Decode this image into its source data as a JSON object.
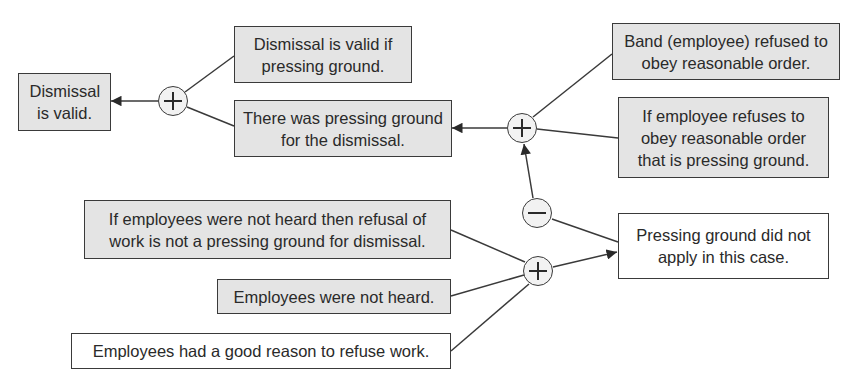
{
  "diagram": {
    "type": "argument-map",
    "nodes": {
      "conclusion": {
        "text": "Dismissal is valid.",
        "style": "grey"
      },
      "rule_valid": {
        "text": "Dismissal is valid if pressing ground.",
        "style": "grey"
      },
      "pressing_ground": {
        "text": "There was pressing ground for the dismissal.",
        "style": "grey"
      },
      "band_refused": {
        "text": "Band (employee) refused to obey reasonable order.",
        "style": "grey"
      },
      "rule_refuse": {
        "text": "If employee refuses to obey reasonable order that is pressing ground.",
        "style": "grey"
      },
      "not_apply": {
        "text": "Pressing ground did not apply in this case.",
        "style": "white"
      },
      "rule_not_heard": {
        "text": "If employees were not heard then refusal of work is not a pressing ground for dismissal.",
        "style": "grey"
      },
      "not_heard": {
        "text": "Employees were not heard.",
        "style": "grey"
      },
      "good_reason": {
        "text": "Employees had a good reason to refuse work.",
        "style": "white"
      }
    },
    "connectors": [
      {
        "id": "plus1",
        "symbol": "+",
        "inputs": [
          "rule_valid",
          "pressing_ground"
        ],
        "output": "conclusion"
      },
      {
        "id": "plus2",
        "symbol": "+",
        "inputs": [
          "band_refused",
          "rule_refuse"
        ],
        "output": "pressing_ground"
      },
      {
        "id": "minus1",
        "symbol": "-",
        "inputs": [
          "not_apply"
        ],
        "output": "plus2"
      },
      {
        "id": "plus3",
        "symbol": "+",
        "inputs": [
          "rule_not_heard",
          "not_heard",
          "good_reason"
        ],
        "output": "not_apply"
      }
    ]
  }
}
